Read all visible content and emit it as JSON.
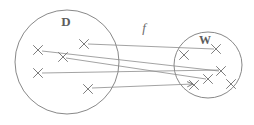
{
  "figure": {
    "type": "set-mapping-diagram",
    "background_color": "#ffffff",
    "ink_color": "#7a7a7a",
    "width": 254,
    "height": 125
  },
  "labels": {
    "domain_set": "D",
    "codomain_set": "W",
    "function": "f"
  },
  "sets": [
    {
      "id": "domain",
      "label": "D",
      "label_x": 66,
      "label_y": 26,
      "cx": 67,
      "cy": 62,
      "rx": 52,
      "ry": 52
    },
    {
      "id": "codomain",
      "label": "W",
      "label_x": 205,
      "label_y": 44,
      "cx": 208,
      "cy": 65,
      "rx": 34,
      "ry": 33
    }
  ],
  "function_label": {
    "text": "f",
    "x": 144,
    "y": 32
  },
  "points": [
    {
      "set": "domain",
      "id": "d1",
      "x": 84,
      "y": 44
    },
    {
      "set": "domain",
      "id": "d2",
      "x": 38,
      "y": 50
    },
    {
      "set": "domain",
      "id": "d3",
      "x": 63,
      "y": 57
    },
    {
      "set": "domain",
      "id": "d4",
      "x": 38,
      "y": 73
    },
    {
      "set": "domain",
      "id": "d5",
      "x": 88,
      "y": 89
    },
    {
      "set": "codomain",
      "id": "w1",
      "x": 184,
      "y": 55
    },
    {
      "set": "codomain",
      "id": "w2",
      "x": 216,
      "y": 49
    },
    {
      "set": "codomain",
      "id": "w3",
      "x": 221,
      "y": 71
    },
    {
      "set": "codomain",
      "id": "w4",
      "x": 208,
      "y": 79
    },
    {
      "set": "codomain",
      "id": "w5",
      "x": 231,
      "y": 84
    },
    {
      "set": "codomain",
      "id": "w6",
      "x": 194,
      "y": 85
    }
  ],
  "mappings": [
    {
      "id": "m1",
      "from": "d1",
      "to": "w2",
      "x1": 88,
      "y1": 44,
      "x2": 214,
      "y2": 49,
      "arrow": false
    },
    {
      "id": "m2",
      "from": "d2",
      "to": "w3",
      "x1": 42,
      "y1": 51,
      "x2": 219,
      "y2": 71,
      "arrow": false
    },
    {
      "id": "m3",
      "from": "d3",
      "to": "w4",
      "x1": 66,
      "y1": 58,
      "x2": 206,
      "y2": 79,
      "arrow": false
    },
    {
      "id": "m4",
      "from": "d4",
      "to": "w3",
      "x1": 42,
      "y1": 73,
      "x2": 219,
      "y2": 70,
      "arrow": false
    },
    {
      "id": "m5",
      "from": "d5",
      "to": "w6",
      "x1": 92,
      "y1": 88,
      "x2": 193,
      "y2": 84,
      "arrow": true
    }
  ],
  "point_marker": {
    "glyph": "x",
    "size": 4.5
  }
}
